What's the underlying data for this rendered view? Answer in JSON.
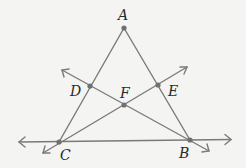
{
  "diagram": {
    "colors": {
      "background": "#f4f4f2",
      "line": "#7a7a7a",
      "point": "#707070",
      "label": "#2a2a2a"
    },
    "points": [
      {
        "name": "A",
        "x": 124,
        "y": 28
      },
      {
        "name": "D",
        "x": 90,
        "y": 86
      },
      {
        "name": "E",
        "x": 158,
        "y": 85
      },
      {
        "name": "F",
        "x": 124,
        "y": 105
      },
      {
        "name": "C",
        "x": 59,
        "y": 142
      },
      {
        "name": "B",
        "x": 190,
        "y": 140
      }
    ],
    "labels": {
      "A": "A",
      "B": "B",
      "C": "C",
      "D": "D",
      "E": "E",
      "F": "F"
    },
    "segments": [
      {
        "from": "A",
        "to": "C"
      },
      {
        "from": "A",
        "to": "B"
      }
    ],
    "lines": [
      {
        "through": [
          "C",
          "B"
        ],
        "type": "line"
      },
      {
        "through": [
          "B",
          "D"
        ],
        "type": "line"
      },
      {
        "through": [
          "C",
          "E"
        ],
        "type": "line"
      }
    ]
  }
}
